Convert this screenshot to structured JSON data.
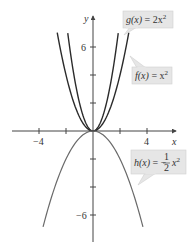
{
  "figure": {
    "axes": {
      "x_label": "x",
      "y_label": "y",
      "x_ticks": [
        {
          "value": -4,
          "label": "−4"
        },
        {
          "value": -2,
          "label": ""
        },
        {
          "value": 2,
          "label": ""
        },
        {
          "value": 4,
          "label": "4"
        }
      ],
      "y_ticks": [
        {
          "value": 6,
          "label": "6"
        },
        {
          "value": 4,
          "label": ""
        },
        {
          "value": 2,
          "label": ""
        },
        {
          "value": -2,
          "label": ""
        },
        {
          "value": -4,
          "label": ""
        },
        {
          "value": -6,
          "label": "−6"
        }
      ]
    },
    "callouts": {
      "g": {
        "text": "g(x) = 2x²",
        "func": "g(x)",
        "eq": " = 2x",
        "sup": "2"
      },
      "f": {
        "text": "f(x) = x²",
        "func": "f(x)",
        "eq": " = x",
        "sup": "2"
      },
      "h": {
        "text": "h(x) = −(1/2)x²",
        "func": "h(x)",
        "eq": " = −",
        "num": "1",
        "den": "2",
        "var": "x",
        "sup": "2"
      }
    },
    "colors": {
      "curve_up": "#2b2b2b",
      "curve_down": "#6a6a6a",
      "axis": "#444444",
      "callout_bg": "#e6e6e6",
      "callout_border": "#cfcfcf"
    }
  },
  "chart_data": {
    "type": "line",
    "title": "",
    "xlabel": "x",
    "ylabel": "y",
    "xlim": [
      -5.5,
      7
    ],
    "ylim": [
      -7.5,
      8
    ],
    "grid": false,
    "series": [
      {
        "name": "g(x) = 2x^2",
        "expression": "2*x^2",
        "domain": [
          -1.87,
          1.87
        ]
      },
      {
        "name": "f(x) = x^2",
        "expression": "x^2",
        "domain": [
          -2.65,
          2.65
        ]
      },
      {
        "name": "h(x) = -1/2 x^2",
        "expression": "-0.5*x^2",
        "domain": [
          -3.7,
          3.7
        ]
      }
    ],
    "x_tick_labels": [
      "-4",
      "4"
    ],
    "y_tick_labels": [
      "6",
      "-6"
    ]
  }
}
